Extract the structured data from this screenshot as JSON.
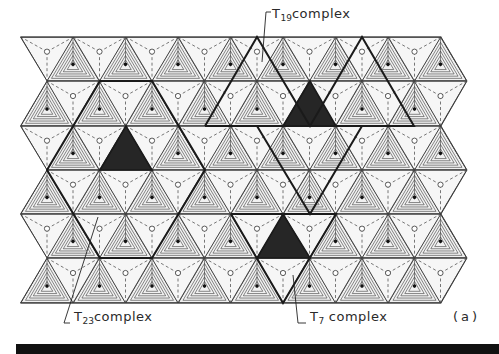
{
  "figure": {
    "panel_label": "(a)",
    "colors": {
      "background": "#ffffff",
      "paper_fill": "#f1f1f1",
      "line": "#3a3a3a",
      "bold_outline": "#1a1a1a",
      "dark_fill": "#262626"
    },
    "grid": {
      "rows_y": [
        37,
        81,
        126,
        170,
        214,
        258,
        303
      ],
      "even_row_x0": 20.5,
      "odd_row_x0": 47,
      "dx": 52.5,
      "columns": 9
    },
    "annotations": [
      {
        "id": "t19",
        "prefix": "T",
        "subscript": "19",
        "suffix": "complex",
        "x": 266,
        "y": 13
      },
      {
        "id": "t23",
        "prefix": "T",
        "subscript": "23",
        "suffix": "complex",
        "x": 72,
        "y": 316
      },
      {
        "id": "t7",
        "prefix": "T",
        "subscript": "7",
        "suffix": " complex",
        "x": 309,
        "y": 316
      }
    ],
    "complexes": [
      {
        "name": "T23 complex",
        "center_apex": [
          126,
          126
        ],
        "dark_triangle": [
          [
            126,
            126
          ],
          [
            100,
            170
          ],
          [
            152,
            170
          ]
        ]
      },
      {
        "name": "T19 complex",
        "center_apex": [
          310,
          81
        ],
        "dark_triangle": [
          [
            310,
            81
          ],
          [
            283,
            126
          ],
          [
            336,
            126
          ]
        ]
      },
      {
        "name": "T7 complex",
        "center_apex": [
          283,
          214
        ],
        "dark_triangle": [
          [
            283,
            214
          ],
          [
            257,
            258
          ],
          [
            310,
            258
          ]
        ]
      }
    ]
  }
}
